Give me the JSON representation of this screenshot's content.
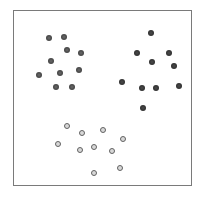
{
  "chart_data": {
    "type": "scatter",
    "title": "",
    "xlabel": "",
    "ylabel": "",
    "grid": false,
    "legend": null,
    "axes_visible": false,
    "frame": {
      "left": 13,
      "top": 10,
      "right": 192,
      "bottom": 186,
      "color": "#7a7a7a"
    },
    "coordinate_note": "point coordinates are pixel positions within the 202x198 image",
    "series": [
      {
        "name": "cluster-top-left",
        "style": "filled",
        "color": "#4a4a4a",
        "points": [
          {
            "x": 48.7,
            "y": 38.3
          },
          {
            "x": 64.0,
            "y": 37.3
          },
          {
            "x": 66.7,
            "y": 49.7
          },
          {
            "x": 80.7,
            "y": 52.7
          },
          {
            "x": 50.7,
            "y": 61.0
          },
          {
            "x": 39.3,
            "y": 75.3
          },
          {
            "x": 59.7,
            "y": 73.3
          },
          {
            "x": 79.0,
            "y": 70.3
          },
          {
            "x": 56.0,
            "y": 86.7
          },
          {
            "x": 72.0,
            "y": 86.7
          }
        ]
      },
      {
        "name": "cluster-top-right",
        "style": "filled",
        "color": "#333333",
        "points": [
          {
            "x": 150.7,
            "y": 33.0
          },
          {
            "x": 136.7,
            "y": 53.0
          },
          {
            "x": 169.3,
            "y": 52.7
          },
          {
            "x": 152.3,
            "y": 61.7
          },
          {
            "x": 174.3,
            "y": 66.0
          },
          {
            "x": 122.3,
            "y": 81.7
          },
          {
            "x": 142.3,
            "y": 88.0
          },
          {
            "x": 155.7,
            "y": 88.0
          },
          {
            "x": 179.0,
            "y": 86.3
          },
          {
            "x": 143.0,
            "y": 108.3
          }
        ]
      },
      {
        "name": "cluster-bottom",
        "style": "hollow",
        "color": "#626262",
        "fill": "#d8d8d8",
        "points": [
          {
            "x": 67.3,
            "y": 126.0
          },
          {
            "x": 81.7,
            "y": 132.7
          },
          {
            "x": 103.3,
            "y": 130.3
          },
          {
            "x": 122.7,
            "y": 139.3
          },
          {
            "x": 58.0,
            "y": 144.0
          },
          {
            "x": 79.7,
            "y": 150.3
          },
          {
            "x": 94.3,
            "y": 147.0
          },
          {
            "x": 111.7,
            "y": 151.0
          },
          {
            "x": 120.3,
            "y": 168.0
          },
          {
            "x": 94.0,
            "y": 173.3
          }
        ]
      }
    ]
  }
}
